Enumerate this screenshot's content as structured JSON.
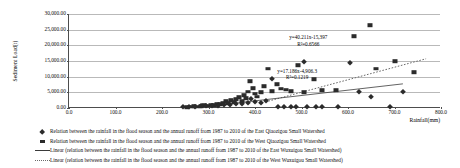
{
  "chart_data": {
    "type": "scatter",
    "title": "",
    "xlabel": "Rainfall(mm)",
    "ylabel": "Sediment Load(t)",
    "xlim": [
      0,
      800
    ],
    "ylim": [
      0,
      30000
    ],
    "xticks": [
      "0.0",
      "100.0",
      "200.0",
      "300.0",
      "400.0",
      "500.0",
      "600.0",
      "700.0",
      "800.0"
    ],
    "xtick_values": [
      0,
      100,
      200,
      300,
      400,
      500,
      600,
      700,
      800
    ],
    "yticks": [
      "0.00",
      "5,000.00",
      "10,000.00",
      "15,000.00",
      "20,000.00",
      "25,000.00",
      "30,000.00"
    ],
    "ytick_values": [
      0,
      5000,
      10000,
      15000,
      20000,
      25000,
      30000
    ],
    "grid": true,
    "legend_position": "bottom",
    "series": [
      {
        "name": "east-watershed-points",
        "marker": "square",
        "color": "#2b2b2b",
        "points": [
          [
            253,
            300
          ],
          [
            262,
            420
          ],
          [
            268,
            520
          ],
          [
            276,
            380
          ],
          [
            284,
            640
          ],
          [
            291,
            900
          ],
          [
            298,
            760
          ],
          [
            305,
            1100
          ],
          [
            312,
            980
          ],
          [
            318,
            1400
          ],
          [
            325,
            1250
          ],
          [
            331,
            1750
          ],
          [
            338,
            2100
          ],
          [
            343,
            1550
          ],
          [
            349,
            2450
          ],
          [
            355,
            1900
          ],
          [
            360,
            2800
          ],
          [
            366,
            3500
          ],
          [
            371,
            2250
          ],
          [
            376,
            4100
          ],
          [
            381,
            3100
          ],
          [
            386,
            5200
          ],
          [
            390,
            8600
          ],
          [
            395,
            6300
          ],
          [
            399,
            4500
          ],
          [
            404,
            3650
          ],
          [
            412,
            5050
          ],
          [
            419,
            6900
          ],
          [
            427,
            12600
          ],
          [
            437,
            5400
          ],
          [
            447,
            7600
          ],
          [
            455,
            6200
          ],
          [
            466,
            5850
          ],
          [
            478,
            5400
          ],
          [
            492,
            13700
          ],
          [
            505,
            5100
          ],
          [
            527,
            9200
          ],
          [
            545,
            5700
          ],
          [
            575,
            5650
          ],
          [
            612,
            22900
          ],
          [
            648,
            26500
          ],
          [
            661,
            12600
          ],
          [
            700,
            15000
          ],
          [
            742,
            11400
          ]
        ]
      },
      {
        "name": "west-watershed-points",
        "marker": "diamond",
        "color": "#2b2b2b",
        "points": [
          [
            246,
            250
          ],
          [
            259,
            330
          ],
          [
            271,
            410
          ],
          [
            283,
            600
          ],
          [
            295,
            520
          ],
          [
            308,
            780
          ],
          [
            321,
            690
          ],
          [
            334,
            1050
          ],
          [
            347,
            870
          ],
          [
            359,
            1300
          ],
          [
            372,
            1150
          ],
          [
            384,
            1600
          ],
          [
            392,
            2950
          ],
          [
            401,
            1900
          ],
          [
            412,
            1450
          ],
          [
            423,
            2150
          ],
          [
            436,
            9300
          ],
          [
            449,
            300
          ],
          [
            462,
            300
          ],
          [
            477,
            300
          ],
          [
            489,
            300
          ],
          [
            505,
            14600
          ],
          [
            512,
            300
          ],
          [
            532,
            300
          ],
          [
            545,
            300
          ],
          [
            579,
            300
          ],
          [
            604,
            14300
          ],
          [
            623,
            5050
          ],
          [
            649,
            3400
          ],
          [
            690,
            300
          ],
          [
            718,
            5200
          ]
        ]
      }
    ],
    "trendlines": [
      {
        "name": "east-watershed-trendline",
        "style": "dotted",
        "color": "#6a6a6a",
        "equation": "y=40.211x-15,397",
        "r2": "R²=0.6566",
        "slope": 40.211,
        "intercept": -15397,
        "x_from": 430,
        "x_to": 770
      },
      {
        "name": "west-watershed-trendline",
        "style": "solid",
        "color": "#3a3a3a",
        "equation": "y=17.186x-4,906.3",
        "r2": "R²=0.1219",
        "slope": 17.186,
        "intercept": -4906.3,
        "x_from": 290,
        "x_to": 720
      }
    ],
    "annotations": [
      {
        "name": "east-equation-annotation",
        "line1": "y=40.211x-15,397",
        "line2": "R²=0.6566",
        "x_pct": 64.5,
        "y_pct": 28
      },
      {
        "name": "west-equation-annotation",
        "line1": "y=17.186x-4,906.3",
        "line2": "R²=0.1219",
        "x_pct": 61.5,
        "y_pct": 64
      }
    ],
    "legend": [
      {
        "key": "diamond",
        "label": "Relation between the rainfall in the flood season and the annual runoff from 1987 to 2010 of the East Qiaozigou Small Watershed"
      },
      {
        "key": "square",
        "label": "Relation between the rainfall in the flood season and the annual runoff from 1987 to 2010 of the West Qiaozigou Small Watershed"
      },
      {
        "key": "solid-line",
        "label": "Linear (relation between the rainfall in the flood season and the annual runoff from 1987 to 2010 of the East Wuxuigou Small Watershed)"
      },
      {
        "key": "dotted-line",
        "label": "Linear (relation between the rainfall in the flood season and the annual runoff from 1987 to 2010 of the West Wuxuigou Small Watershed)"
      }
    ]
  }
}
